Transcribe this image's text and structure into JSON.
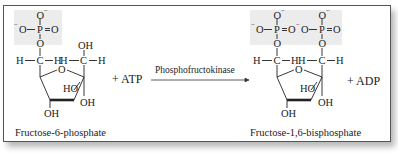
{
  "reaction": {
    "reactant": {
      "name": "Fructose-6-phosphate",
      "phosphate_groups": 1,
      "labels": {
        "o_minus_top": "O",
        "minus": "−",
        "o_minus_left": "O",
        "p": "P",
        "o_double": "O",
        "o_link": "O",
        "h": "H",
        "c": "C",
        "oh": "OH",
        "ho": "HO",
        "ring_o": "O"
      }
    },
    "cosubstrate": "+ ATP",
    "enzyme": "Phosphofructokinase",
    "product": {
      "name": "Fructose-1,6-bisphosphate",
      "phosphate_groups": 2
    },
    "coproduct": "+ ADP"
  },
  "style": {
    "border_color": "#555555",
    "shade_color": "#ececec",
    "ink_color": "#222222"
  }
}
